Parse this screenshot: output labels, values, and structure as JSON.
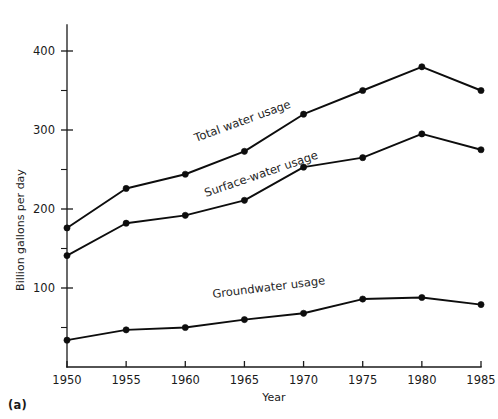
{
  "figure": {
    "panel_label": "(a)"
  },
  "chart_data": {
    "type": "line",
    "title": "",
    "xlabel": "Year",
    "ylabel": "Billion gallons per day",
    "x": [
      1950,
      1955,
      1960,
      1965,
      1970,
      1975,
      1980,
      1985
    ],
    "xtick_labels": [
      "1950",
      "1955",
      "1960",
      "1965",
      "1970",
      "1975",
      "1980",
      "1985"
    ],
    "xlim": [
      1950,
      1985
    ],
    "ylim": [
      0,
      430
    ],
    "ytick_labels": [
      "100",
      "200",
      "300",
      "400"
    ],
    "yticks": [
      100,
      200,
      300,
      400
    ],
    "yticks_minor": [
      50,
      150,
      250,
      350
    ],
    "grid": false,
    "legend_position": "inline-labels",
    "series": [
      {
        "name": "Total water usage",
        "label_text": "Total water usage",
        "values": [
          176,
          226,
          244,
          273,
          320,
          350,
          380,
          350
        ]
      },
      {
        "name": "Surface-water usage",
        "label_text": "Surface-water usage",
        "values": [
          141,
          182,
          192,
          211,
          253,
          265,
          295,
          275
        ]
      },
      {
        "name": "Groundwater usage",
        "label_text": "Groundwater usage",
        "values": [
          34,
          47,
          50,
          60,
          68,
          86,
          88,
          79
        ]
      }
    ],
    "colors": {
      "line": "#0d0d0d",
      "axis": "#1a1a1a",
      "background": "#ffffff"
    }
  }
}
